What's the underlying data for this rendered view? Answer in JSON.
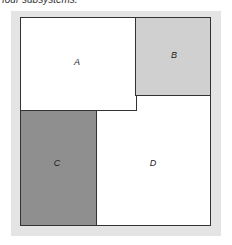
{
  "caption": "four subsystems.",
  "regions": [
    {
      "id": "A",
      "label": "A",
      "fill": "#ffffff"
    },
    {
      "id": "B",
      "label": "B",
      "fill": "#d0d0d0"
    },
    {
      "id": "C",
      "label": "C",
      "fill": "#8f8f8f"
    },
    {
      "id": "D",
      "label": "D",
      "fill": "#ffffff"
    }
  ],
  "colors": {
    "background_panel": "#e4e4e4",
    "border": "#333333"
  }
}
